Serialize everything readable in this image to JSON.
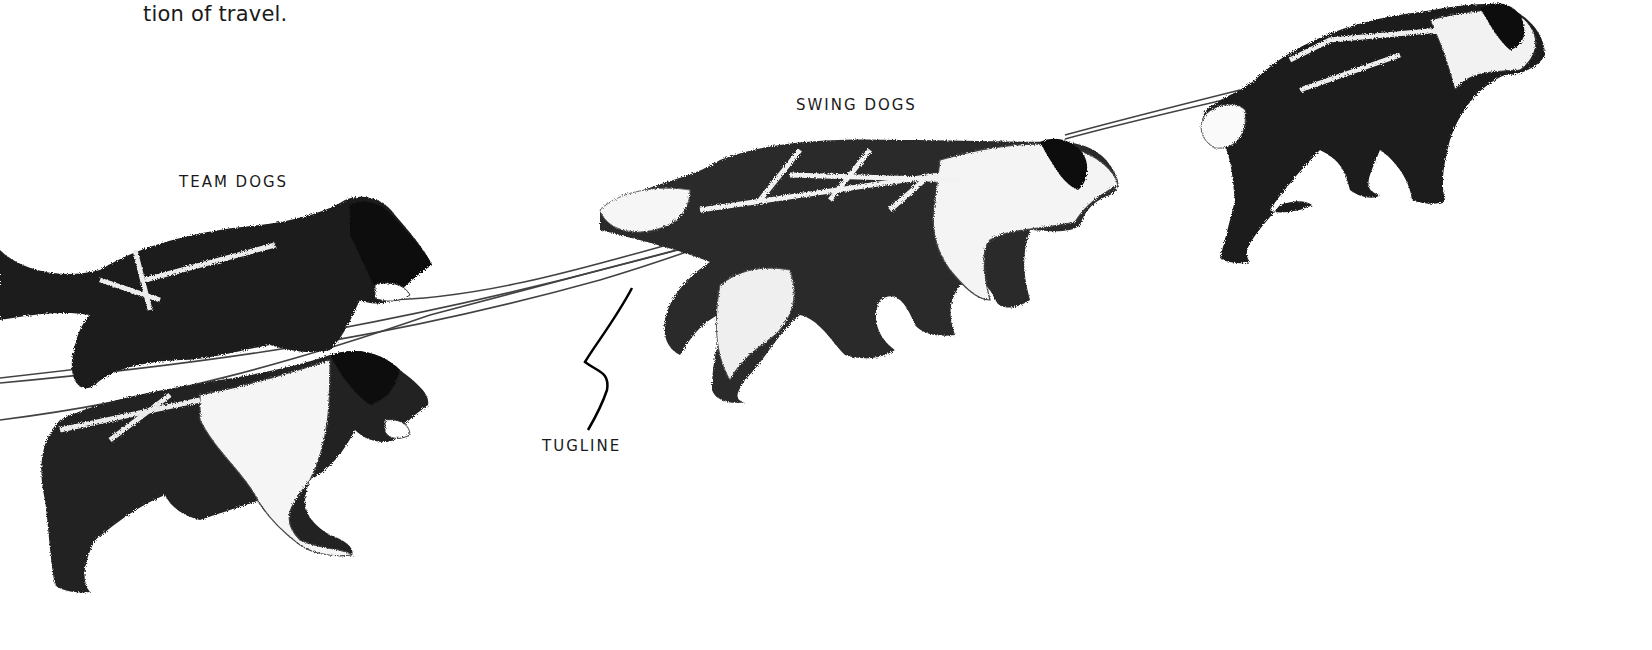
{
  "page": {
    "text_fragment": "tion of travel."
  },
  "illustration": {
    "subject": "sled dog team in harness",
    "labels": {
      "team_dogs": "TEAM DOGS",
      "swing_dogs": "SWING DOGS",
      "tugline": "TUGLINE"
    },
    "colors": {
      "ink": "#111111",
      "paper": "#ffffff"
    }
  }
}
